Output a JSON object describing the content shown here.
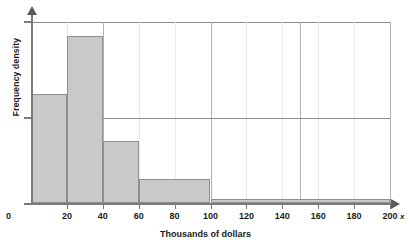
{
  "chart_data": {
    "type": "bar",
    "title": "",
    "subtitle": "",
    "xlabel": "Thousands of dollars",
    "ylabel": "Frequency density",
    "axis_variable": "x",
    "grid": true,
    "legend": null,
    "xlim": [
      0,
      200
    ],
    "ylim": [
      0,
      1
    ],
    "xticks": [
      0,
      20,
      40,
      60,
      80,
      100,
      120,
      140,
      160,
      180,
      200
    ],
    "xtick_labels": [
      "0",
      "20",
      "40",
      "60",
      "80",
      "100",
      "120",
      "140",
      "160",
      "180",
      "200"
    ],
    "yticks": [
      0.5,
      1.0
    ],
    "ytick_labels": [
      "",
      ""
    ],
    "bins": [
      {
        "label": "0-20",
        "x_start": 0,
        "x_end": 20,
        "density": 0.6
      },
      {
        "label": "20-40",
        "x_start": 20,
        "x_end": 40,
        "density": 0.92
      },
      {
        "label": "40-60",
        "x_start": 40,
        "x_end": 60,
        "density": 0.34
      },
      {
        "label": "60-100",
        "x_start": 60,
        "x_end": 100,
        "density": 0.13
      },
      {
        "label": "100-200",
        "x_start": 100,
        "x_end": 200,
        "density": 0.02
      }
    ],
    "categories": [
      "0-20",
      "20-40",
      "40-60",
      "60-100",
      "100-200"
    ],
    "values": [
      0.6,
      0.92,
      0.34,
      0.13,
      0.02
    ],
    "colors": {
      "bar_fill": "#c9c9c9",
      "bar_stroke": "#8f8f8f",
      "axis": "#7a7a7a",
      "grid_minor": "#e9e9e9",
      "grid_major": "#b3b3b3",
      "text": "#1a1a1a"
    },
    "major_gridlines_x": [
      40,
      100,
      150,
      200
    ]
  }
}
